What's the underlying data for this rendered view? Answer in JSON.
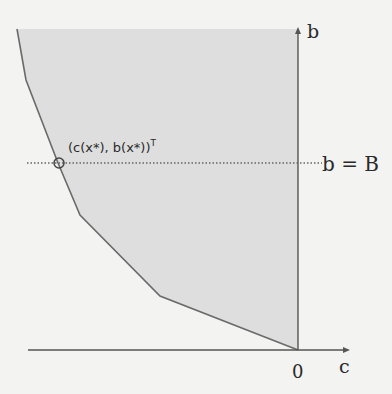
{
  "diagram": {
    "axes": {
      "x_label": "c",
      "y_label": "b",
      "origin_label": "0"
    },
    "point": {
      "label": "(c(x*), b(x*))",
      "superscript": "T"
    },
    "constraint": {
      "label": "b = B"
    },
    "colors": {
      "region_fill": "#dedede",
      "frontier": "#6a6a6a",
      "axis": "#555555",
      "background": "#f3f3f1"
    },
    "frontier_points": [
      [
        17,
        29
      ],
      [
        26,
        80
      ],
      [
        58,
        163
      ],
      [
        80,
        215
      ],
      [
        160,
        296
      ],
      [
        298,
        350
      ]
    ]
  }
}
